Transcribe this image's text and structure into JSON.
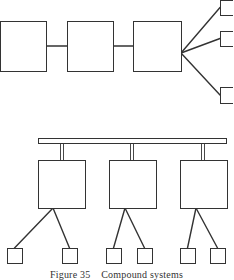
{
  "figure": {
    "caption": "Figure 35    Compound systems",
    "stroke_color": "#333333",
    "background": "#ffffff"
  },
  "top_chain": {
    "boxes": [
      {
        "id": "chain-box-1",
        "x": 0,
        "y": 21,
        "w": 46,
        "h": 50
      },
      {
        "id": "chain-box-2",
        "x": 67,
        "y": 21,
        "w": 46,
        "h": 50
      },
      {
        "id": "chain-box-3",
        "x": 133,
        "y": 21,
        "w": 48,
        "h": 50
      }
    ],
    "fan_origin": {
      "x": 181,
      "y": 53
    },
    "fan_targets": [
      {
        "id": "fan-box-1",
        "x": 220,
        "y": 0,
        "w": 16,
        "h": 15
      },
      {
        "id": "fan-box-2",
        "x": 220,
        "y": 31,
        "w": 16,
        "h": 15
      },
      {
        "id": "fan-box-3",
        "x": 220,
        "y": 87,
        "w": 16,
        "h": 16
      }
    ]
  },
  "bus_system": {
    "bar": {
      "x": 38,
      "y": 138,
      "w": 188,
      "h": 5
    },
    "units": [
      {
        "id": "unit-a",
        "stem_x": 62,
        "box": {
          "x": 38,
          "y": 160,
          "w": 47,
          "h": 48
        },
        "apex": {
          "x": 53,
          "y": 208
        },
        "leaves": [
          {
            "x": 7,
            "y": 248,
            "w": 15,
            "h": 15
          },
          {
            "x": 62,
            "y": 248,
            "w": 15,
            "h": 15
          }
        ]
      },
      {
        "id": "unit-b",
        "stem_x": 132,
        "box": {
          "x": 109,
          "y": 160,
          "w": 47,
          "h": 48
        },
        "apex": {
          "x": 125,
          "y": 208
        },
        "leaves": [
          {
            "x": 106,
            "y": 248,
            "w": 15,
            "h": 15
          },
          {
            "x": 137,
            "y": 248,
            "w": 15,
            "h": 15
          }
        ]
      },
      {
        "id": "unit-c",
        "stem_x": 203,
        "box": {
          "x": 180,
          "y": 160,
          "w": 47,
          "h": 48
        },
        "apex": {
          "x": 196,
          "y": 208
        },
        "leaves": [
          {
            "x": 180,
            "y": 248,
            "w": 15,
            "h": 15
          },
          {
            "x": 210,
            "y": 248,
            "w": 15,
            "h": 15
          }
        ]
      }
    ]
  }
}
